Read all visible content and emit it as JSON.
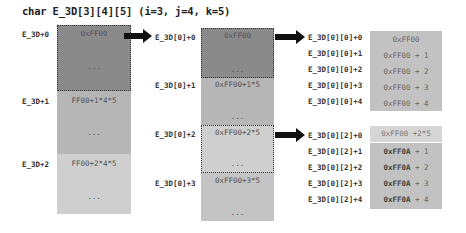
{
  "title": "char E_3D[3][4][5] (i=3, j=4, k=5)",
  "col1": {
    "labels": [
      "E_3D+0",
      "E_3D+1",
      "E_3D+2"
    ],
    "blocks": [
      {
        "value": "0xFF00",
        "ellipsis": "...",
        "color": "#8a8a8a"
      },
      {
        "value": "FF00+1*4*5",
        "ellipsis": "...",
        "color": "#b6b6b6"
      },
      {
        "value": "FF00+2*4*5",
        "ellipsis": "...",
        "color": "#cfcfcf"
      }
    ]
  },
  "col2": {
    "labels": [
      "E_3D[0]+0",
      "E_3D[0]+1",
      "E_3D[0]+2",
      "E_3D[0]+3"
    ],
    "blocks": [
      {
        "value": "0xFF00",
        "ellipsis": "...",
        "color": "#8a8a8a"
      },
      {
        "value": "0xFF00+1*5",
        "ellipsis": "...",
        "color": "#b6b6b6"
      },
      {
        "value": "0xFF00+2*5",
        "ellipsis": "...",
        "color": "#cfcfcf"
      },
      {
        "value": "0xFF00+3*5",
        "ellipsis": "...",
        "color": "#c4c4c4"
      }
    ]
  },
  "col3a": {
    "labels": [
      "E_3D[0][0]+0",
      "E_3D[0][0]+1",
      "E_3D[0][0]+2",
      "E_3D[0][0]+3",
      "E_3D[0][0]+4"
    ],
    "values": [
      "0xFF00",
      "0xFF00 + 1",
      "0xFF00 + 2",
      "0xFF00 + 3",
      "0xFF00 + 4"
    ],
    "color": "#c2c2c2"
  },
  "col3b": {
    "labels": [
      "E_3D[0][2]+0",
      "E_3D[0][2]+1",
      "E_3D[0][2]+2",
      "E_3D[0][2]+3",
      "E_3D[0][2]+4"
    ],
    "first_value": "0xFF00 +2*5",
    "bold_prefix": "0xFF0A",
    "suffixes": [
      " + 1",
      " + 2",
      " + 3",
      " + 4"
    ],
    "first_color": "#d6d6d6",
    "color": "#c2c2c2"
  }
}
